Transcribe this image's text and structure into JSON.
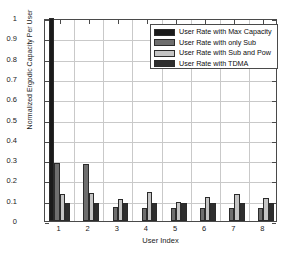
{
  "chart_data": {
    "type": "bar",
    "title": "",
    "xlabel": "User Index",
    "ylabel": "Normalized Ergodic Capacity Per User",
    "categories": [
      "1",
      "2",
      "3",
      "4",
      "5",
      "6",
      "7",
      "8"
    ],
    "xlim": [
      0.5,
      8.5
    ],
    "ylim": [
      0,
      1
    ],
    "ytick_labels": [
      "0",
      "0.1",
      "0.2",
      "0.3",
      "0.4",
      "0.5",
      "0.6",
      "0.7",
      "0.8",
      "0.9",
      "1"
    ],
    "ytick_values": [
      0,
      0.1,
      0.2,
      0.3,
      0.4,
      0.5,
      0.6,
      0.7,
      0.8,
      0.9,
      1
    ],
    "grid": true,
    "legend_position": "upper right",
    "series": [
      {
        "name": "User Rate with Max Capacity",
        "color": "#1a1a1a",
        "values": [
          1.0,
          0,
          0,
          0,
          0,
          0,
          0,
          0
        ]
      },
      {
        "name": "User Rate with only Sub",
        "color": "#6e6e6e",
        "values": [
          0.285,
          0.283,
          0.067,
          0.065,
          0.064,
          0.066,
          0.066,
          0.063
        ]
      },
      {
        "name": "User Rate with Sub and Pow",
        "color": "#c4c4c4",
        "values": [
          0.135,
          0.137,
          0.108,
          0.143,
          0.093,
          0.116,
          0.133,
          0.112
        ]
      },
      {
        "name": "User Rate with TDMA",
        "color": "#2e2e2e",
        "values": [
          0.087,
          0.087,
          0.087,
          0.087,
          0.087,
          0.087,
          0.087,
          0.087
        ]
      }
    ]
  },
  "axes": {
    "frame_color": "#4a4a4a",
    "grid_color": "#c9c9c9",
    "background": "#ffffff"
  }
}
